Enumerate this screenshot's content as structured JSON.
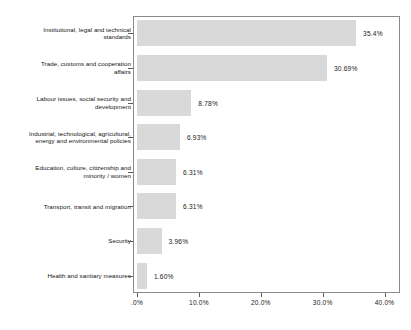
{
  "chart_data": {
    "type": "bar",
    "orientation": "horizontal",
    "title": "",
    "xlabel": "",
    "ylabel": "",
    "xlim": [
      0,
      42.5
    ],
    "grid": false,
    "legend": null,
    "categories": [
      "Institutional, legal and technical standards",
      "Trade, customs and cooperation affairs",
      "Labour issues, social security and development",
      "Industrial, technological, agricultural, energy and environmental policies",
      "Education, culture, citizenship and minority / women",
      "Transport, transit and migration",
      "Security",
      "Health and sanitary measures"
    ],
    "category_lines": [
      [
        "Institutional, legal and technical",
        "standards"
      ],
      [
        "Trade, customs and cooperation",
        "affairs"
      ],
      [
        "Labour issues, social security and",
        "development"
      ],
      [
        "Industrial, technological, agricultural,",
        "energy and environmental policies"
      ],
      [
        "Education, culture, citizenship and",
        "minority / women"
      ],
      [
        "Transport, transit and migration"
      ],
      [
        "Security"
      ],
      [
        "Health and sanitary measures"
      ]
    ],
    "values": [
      35.4,
      30.69,
      8.78,
      6.93,
      6.31,
      6.31,
      3.96,
      1.6
    ],
    "value_labels": [
      "35.4%",
      "30.69%",
      "8.78%",
      "6.93%",
      "6.31%",
      "6.31%",
      "3.96%",
      "1.60%"
    ],
    "xticks": [
      0,
      10,
      20,
      30,
      40
    ],
    "xtick_labels": [
      ".0%",
      "10.0%",
      "20.0%",
      "30.0%",
      "40.0%"
    ],
    "bar_color": "#d9d9d9",
    "frame_color": "#8a8a8a",
    "text_color": "#141414",
    "background": "#ffffff"
  }
}
